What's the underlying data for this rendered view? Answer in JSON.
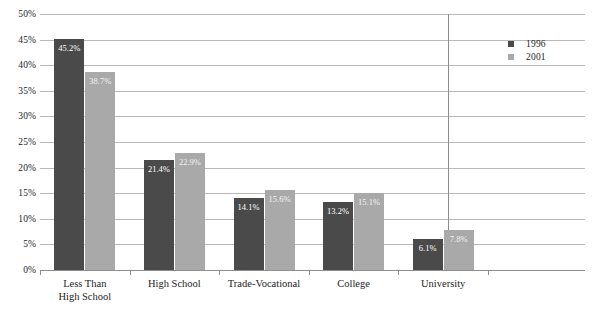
{
  "chart_data": {
    "type": "bar",
    "title": "",
    "xlabel": "",
    "ylabel": "",
    "ylim": [
      0,
      50
    ],
    "ytick_labels": [
      "50%",
      "45%",
      "40%",
      "35%",
      "30%",
      "25%",
      "20%",
      "15%",
      "10%",
      "5%",
      "0%"
    ],
    "ytick_values": [
      50,
      45,
      40,
      35,
      30,
      25,
      20,
      15,
      10,
      5,
      0
    ],
    "grid": true,
    "legend_position": "right",
    "categories": [
      "Less Than High School",
      "High School",
      "Trade-Vocational",
      "College",
      "University"
    ],
    "category_lines": [
      [
        "Less Than",
        "High School"
      ],
      [
        "High School",
        ""
      ],
      [
        "Trade-Vocational",
        ""
      ],
      [
        "College",
        ""
      ],
      [
        "University",
        ""
      ]
    ],
    "series": [
      {
        "name": "1996",
        "color": "#4a4a4a",
        "values": [
          45.2,
          21.4,
          14.1,
          13.2,
          6.1
        ],
        "labels": [
          "45.2%",
          "21.4%",
          "14.1%",
          "13.2%",
          "6.1%"
        ]
      },
      {
        "name": "2001",
        "color": "#a9a9a9",
        "values": [
          38.7,
          22.9,
          15.6,
          15.1,
          7.8
        ],
        "labels": [
          "38.7%",
          "22.9%",
          "15.6%",
          "15.1%",
          "7.8%"
        ]
      }
    ]
  },
  "legend": {
    "entries": [
      {
        "label": "1996",
        "color": "#4a4a4a"
      },
      {
        "label": "2001",
        "color": "#a9a9a9"
      }
    ]
  },
  "colors": {
    "series_1996": "#4a4a4a",
    "series_2001": "#a9a9a9",
    "gridline": "#b9b9b9",
    "axis": "#8d8d8d",
    "text": "#232323",
    "background": "#ffffff"
  }
}
